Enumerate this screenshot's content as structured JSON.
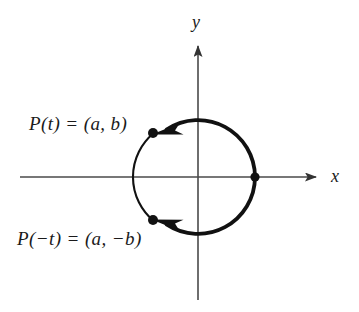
{
  "figure": {
    "background_color": "#ffffff",
    "ink_color": "#1a1a1a",
    "axis_color": "#4a4a4a"
  },
  "axes": {
    "x_label": "x",
    "y_label": "y",
    "origin": {
      "x": 198,
      "y": 177
    },
    "x_axis": {
      "start_x": 20,
      "end_x": 318,
      "y": 177,
      "arrow": "right"
    },
    "y_axis": {
      "x": 198,
      "start_y": 300,
      "end_y": 44,
      "arrow": "up"
    }
  },
  "circle": {
    "center_x": 198,
    "center_y": 177,
    "radius": 57,
    "stroke_width_main": 3.6,
    "stroke_width_minor": 2.0
  },
  "points": [
    {
      "name": "point-start",
      "label": "",
      "x": 255,
      "y": 177,
      "radius": 4.6,
      "description": "start point on positive x-axis"
    },
    {
      "name": "point-p-t",
      "label": "P(t) = (a, b)",
      "x": 153,
      "y": 133,
      "radius": 5.0,
      "description": "terminal point for parameter t in second quadrant"
    },
    {
      "name": "point-p-neg-t",
      "label": "P(−t) = (a, −b)",
      "x": 153,
      "y": 220,
      "radius": 5.0,
      "description": "terminal point for parameter minus t in third quadrant"
    }
  ],
  "labels": {
    "p_t": "P(t) = (a, b)",
    "p_neg_t": "P(−t) = (a, −b)",
    "x_axis": "x",
    "y_axis": "y"
  },
  "arcs": [
    {
      "name": "arc-counterclockwise",
      "direction": "counterclockwise",
      "from": "point-start",
      "to": "point-p-t",
      "arrowhead": "at-end-pointing-left",
      "description": "thick arc sweeping over the top from (1,0) to P(t)"
    },
    {
      "name": "arc-clockwise",
      "direction": "clockwise",
      "from": "point-start",
      "to": "point-p-neg-t",
      "arrowhead": "at-end-pointing-left",
      "description": "thick arc sweeping under the bottom from (1,0) to P(-t)"
    },
    {
      "name": "arc-left-thin",
      "direction": "none",
      "from": "point-p-t",
      "to": "point-p-neg-t",
      "arrowhead": "none",
      "description": "thin arc closing the circle on the left side"
    }
  ]
}
